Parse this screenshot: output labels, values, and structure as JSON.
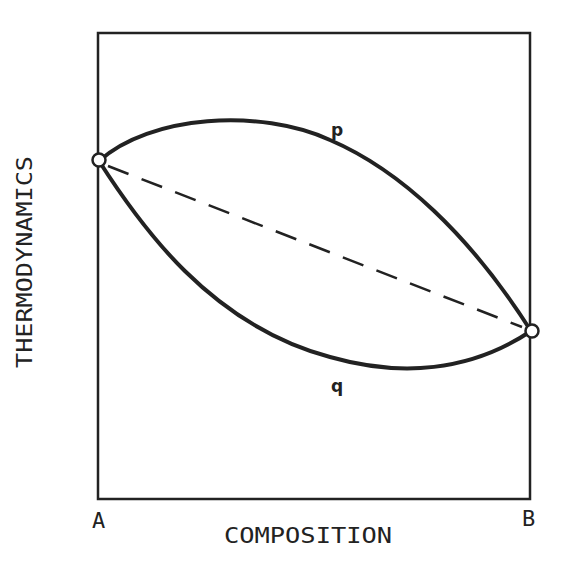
{
  "figure": {
    "y_axis_label": "THERMODYNAMICS",
    "x_axis_label": "COMPOSITION",
    "left_endpoint_label": "A",
    "right_endpoint_label": "B",
    "curves": [
      {
        "id": "p",
        "label": "p",
        "style": "solid",
        "shape": "concave (above chord)"
      },
      {
        "id": "q",
        "label": "q",
        "style": "solid",
        "shape": "convex (below chord)"
      },
      {
        "id": "chord",
        "label": "",
        "style": "dashed",
        "shape": "straight line A to B"
      }
    ],
    "endpoints": [
      {
        "id": "A",
        "marker": "open-circle"
      },
      {
        "id": "B",
        "marker": "open-circle"
      }
    ],
    "colors": {
      "line": "#222222",
      "background": "#ffffff"
    }
  }
}
